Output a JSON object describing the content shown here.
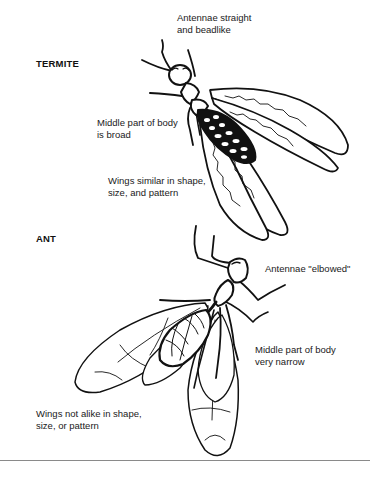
{
  "diagram": {
    "type": "comparison-illustration",
    "sections": [
      {
        "title": "TERMITE",
        "labels": {
          "antennae": [
            "Antennae straight",
            "and beadlike"
          ],
          "body": [
            "Middle part of body",
            "is broad"
          ],
          "wings": [
            "Wings similar in shape,",
            "size, and pattern"
          ]
        }
      },
      {
        "title": "ANT",
        "labels": {
          "antennae": [
            "Antennae \"elbowed\""
          ],
          "body": [
            "Middle part of body",
            "very narrow"
          ],
          "wings": [
            "Wings not alike in shape,",
            "size, or pattern"
          ]
        }
      }
    ],
    "colors": {
      "ink": "#111111",
      "background": "#ffffff",
      "rule": "#8a8a8a"
    }
  }
}
